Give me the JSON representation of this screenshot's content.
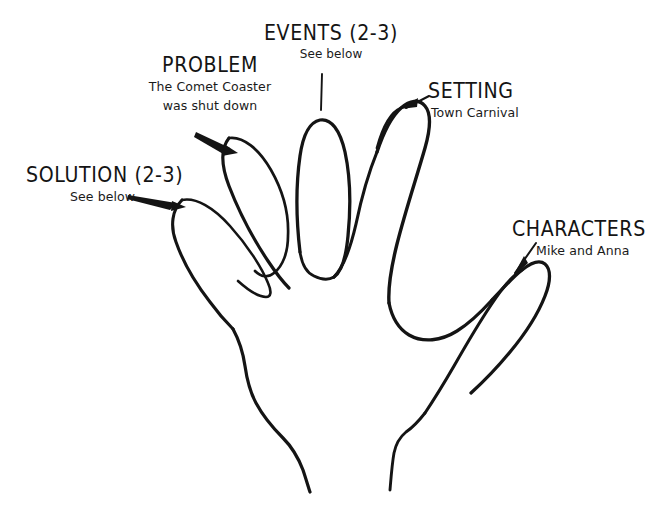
{
  "diagram": {
    "type": "five-finger-story-planner",
    "background_color": "#ffffff",
    "ink_color": "#141414"
  },
  "labels": [
    {
      "id": "solution",
      "title": "SOLUTION (2-3)",
      "subtitle": "See below",
      "points_to": "pinky-finger",
      "pointer": "arrow"
    },
    {
      "id": "problem",
      "title": "PROBLEM",
      "subtitle": "The Comet Coaster\nwas shut down",
      "subtitle_line1": "The Comet Coaster",
      "subtitle_line2": "was shut down",
      "points_to": "ring-finger",
      "pointer": "arrow"
    },
    {
      "id": "events",
      "title": "EVENTS (2-3)",
      "subtitle": "See below",
      "points_to": "middle-finger",
      "pointer": "line"
    },
    {
      "id": "setting",
      "title": "SETTING",
      "subtitle": "Town Carnival",
      "points_to": "index-finger",
      "pointer": "arrow"
    },
    {
      "id": "characters",
      "title": "CHARACTERS",
      "subtitle": "Mike and Anna",
      "points_to": "thumb",
      "pointer": "arrow"
    }
  ]
}
